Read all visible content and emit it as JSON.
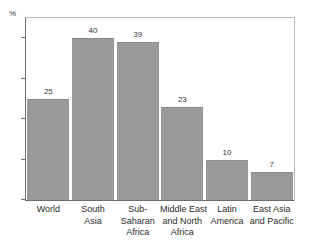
{
  "chart_data": {
    "type": "bar",
    "title": "",
    "subtitle": "",
    "xlabel": "",
    "ylabel": "%",
    "ylim": [
      0,
      45
    ],
    "grid": false,
    "legend": "none",
    "orientation": "vertical",
    "bar_color": "#999999",
    "categories": [
      "World",
      "South Asia",
      "Sub-Saharan Africa",
      "Middle East and North Africa",
      "Latin America",
      "East Asia and Pacific"
    ],
    "category_lines": [
      [
        "World"
      ],
      [
        "South",
        "Asia"
      ],
      [
        "Sub-",
        "Saharan",
        "Africa"
      ],
      [
        "Middle East",
        "and North",
        "Africa"
      ],
      [
        "Latin",
        "America"
      ],
      [
        "East Asia",
        "and Pacific"
      ]
    ],
    "values": [
      25,
      40,
      39,
      23,
      10,
      7
    ],
    "value_labels": [
      "25",
      "40",
      "39",
      "23",
      "10",
      "7"
    ],
    "yticks": [
      0,
      10,
      20,
      30,
      40
    ],
    "ytick_labels": [
      "0",
      "10",
      "20",
      "30",
      "40"
    ]
  },
  "axis": {
    "unit_label": "%"
  }
}
